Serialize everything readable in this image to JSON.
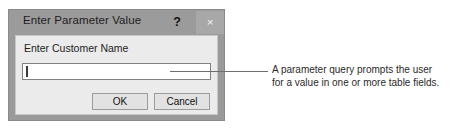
{
  "dialog": {
    "title": "Enter Parameter Value",
    "help_icon": "?",
    "close_icon": "×",
    "prompt_label": "Enter Customer Name",
    "input": {
      "value": "",
      "placeholder": ""
    },
    "buttons": {
      "ok": "OK",
      "cancel": "Cancel"
    }
  },
  "annotation": {
    "line1": "A parameter query prompts the user",
    "line2": "for a value in one or more table fields."
  },
  "colors": {
    "titlebar": "#9b9b9b",
    "dialog_body": "#ebebeb",
    "button_face": "#e2e2e2",
    "leader_line": "#6e6e6e",
    "page_background": "#ffffff"
  }
}
